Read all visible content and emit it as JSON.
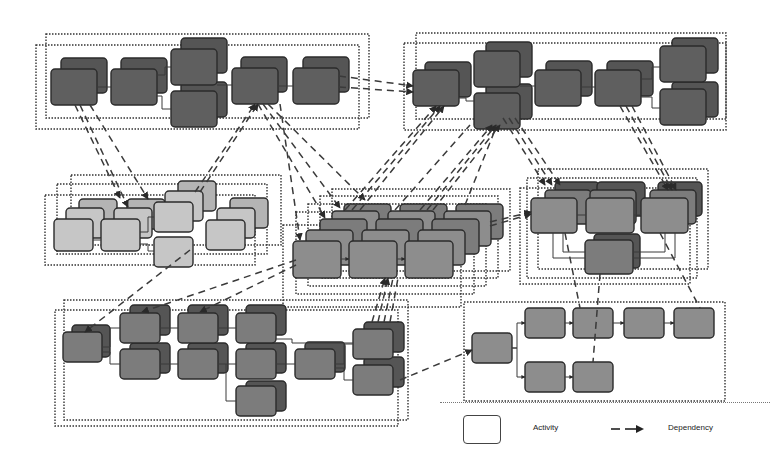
{
  "legend": {
    "activity_label": "Activity",
    "dependency_label": "Dependency"
  },
  "colors": {
    "dark_activity": "#5e5e5e",
    "medium_activity": "#8c8c8c",
    "light_activity": "#c4c4c4",
    "border": "#2e2e2e",
    "dependency_line": "#3a3a3a",
    "group_outline": "#333333"
  },
  "groups": [
    {
      "id": "top-left",
      "shade": "dark",
      "layers": 2
    },
    {
      "id": "top-right",
      "shade": "dark",
      "layers": 2
    },
    {
      "id": "middle-left",
      "shade": "light",
      "layers": 3
    },
    {
      "id": "middle-center",
      "shade": "medium",
      "layers": 5
    },
    {
      "id": "middle-right",
      "shade": "dark-medium",
      "layers": 3
    },
    {
      "id": "bottom-left",
      "shade": "medium-dark",
      "layers": 2
    },
    {
      "id": "bottom-right",
      "shade": "medium",
      "layers": 1
    }
  ]
}
